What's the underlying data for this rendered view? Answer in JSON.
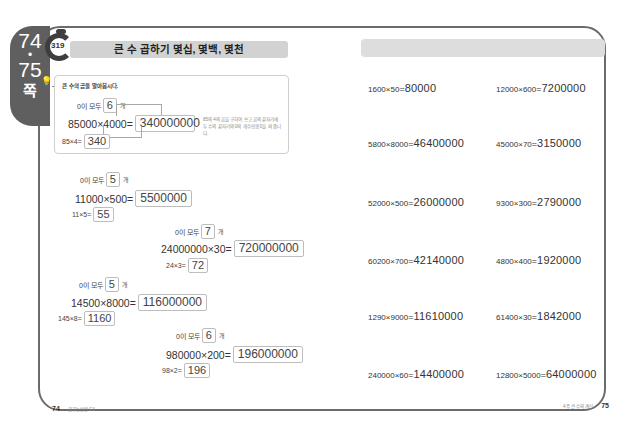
{
  "page_tab": {
    "page_start": "74",
    "dot": "•",
    "page_end": "75",
    "unit": "쪽"
  },
  "lesson": {
    "number": "319",
    "title": "큰 수 곱하기 몇십, 몇백, 몇천"
  },
  "guide": {
    "icon": "lightbulb-character-icon",
    "prompt": "큰 수의 곱을 알아봅시다.",
    "zero_count_label": "0이 모두",
    "zero_count": "6",
    "count_unit": "개",
    "expression": "85000×4000=",
    "result": "340000000",
    "base_expression": "85×4=",
    "base_result": "340",
    "note": "85와 4의 곱을 구하여 쓰고 곱의 끝자리에 두 수의 끝자리의 0의 개수만큼 0을 써 줍니다."
  },
  "left_problems": [
    {
      "zero_label": "0이 모두",
      "zero_count": "5",
      "unit": "개",
      "expression": "11000×500=",
      "result": "5500000",
      "base_expression": "11×5=",
      "base_result": "55"
    },
    {
      "zero_label": "0이 모두",
      "zero_count": "7",
      "unit": "개",
      "expression": "24000000×30=",
      "result": "720000000",
      "base_expression": "24×3=",
      "base_result": "72"
    },
    {
      "zero_label": "0이 모두",
      "zero_count": "5",
      "unit": "개",
      "expression": "14500×8000=",
      "result": "116000000",
      "base_expression": "145×8=",
      "base_result": "1160"
    },
    {
      "zero_label": "0이 모두",
      "zero_count": "6",
      "unit": "개",
      "expression": "980000×200=",
      "result": "196000000",
      "base_expression": "98×2=",
      "base_result": "196"
    }
  ],
  "right_problems": [
    {
      "lhs": "1600×50",
      "eq": "=",
      "rhs": "80000"
    },
    {
      "lhs": "12000×600",
      "eq": "=",
      "rhs": "7200000"
    },
    {
      "lhs": "5800×8000",
      "eq": "=",
      "rhs": "46400000"
    },
    {
      "lhs": "45000×70",
      "eq": "=",
      "rhs": "3150000"
    },
    {
      "lhs": "52000×500",
      "eq": "=",
      "rhs": "26000000"
    },
    {
      "lhs": "9300×300",
      "eq": "=",
      "rhs": "2790000"
    },
    {
      "lhs": "60200×700",
      "eq": "=",
      "rhs": "42140000"
    },
    {
      "lhs": "4800×400",
      "eq": "=",
      "rhs": "1920000"
    },
    {
      "lhs": "1290×9000",
      "eq": "=",
      "rhs": "11610000"
    },
    {
      "lhs": "61400×30",
      "eq": "=",
      "rhs": "1842000"
    },
    {
      "lhs": "240000×60",
      "eq": "=",
      "rhs": "14400000"
    },
    {
      "lhs": "12800×5000",
      "eq": "=",
      "rhs": "64000000"
    }
  ],
  "footer": {
    "left_page": "74",
    "left_text": "꿈꾸는빈칸 C4",
    "right_text": "4주 큰 수의 계산",
    "right_page": "75"
  }
}
